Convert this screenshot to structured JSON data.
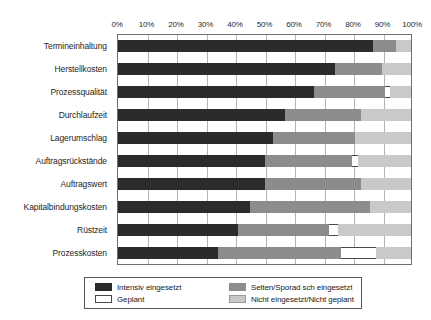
{
  "chart_data": {
    "type": "bar",
    "title": "",
    "subtitle": "",
    "orientation": "horizontal",
    "stacked": true,
    "normalized_percent": true,
    "xlabel": "",
    "ylabel": "",
    "xlim": [
      0,
      100
    ],
    "grid": true,
    "legend_position": "bottom",
    "tick_labels": [
      "0%",
      "10%",
      "20%",
      "30%",
      "40%",
      "50%",
      "60%",
      "70%",
      "80%",
      "90%",
      "100%"
    ],
    "tick_values": [
      0,
      10,
      20,
      30,
      40,
      50,
      60,
      70,
      80,
      90,
      100
    ],
    "categories": [
      "Termineinhaltung",
      "Herstellkosten",
      "Prozessqualität",
      "Durchlaufzeit",
      "Lagerumschlag",
      "Auftragsrückstände",
      "Auftragswert",
      "Kapitalbindungskosten",
      "Rüstzeit",
      "Prozesskosten"
    ],
    "series": [
      {
        "name": "Intensiv eingesetzt",
        "color": "#2b2b2b",
        "values": [
          87,
          74,
          67,
          57,
          53,
          50,
          50,
          45,
          41,
          34
        ]
      },
      {
        "name": "Selten/Sporad sch eingesetzt",
        "color": "#8c8c8c",
        "values": [
          8,
          16,
          24,
          26,
          28,
          30,
          33,
          41,
          31,
          42
        ]
      },
      {
        "name": "Geplant",
        "color": "#ffffff",
        "values": [
          0,
          0,
          2,
          0,
          0,
          2,
          0,
          0,
          3,
          12
        ]
      },
      {
        "name": "Nicht eingesetzt/Nicht geplant",
        "color": "#c9c9c9",
        "values": [
          5,
          10,
          7,
          17,
          19,
          18,
          17,
          14,
          25,
          12
        ]
      }
    ]
  },
  "legend": {
    "items": [
      {
        "label": "Intensiv eingesetzt",
        "swatch": "swatch-dark"
      },
      {
        "label": "Selten/Sporad sch eingesetzt",
        "swatch": "swatch-medium-gray"
      },
      {
        "label": "Geplant",
        "swatch": "swatch-white"
      },
      {
        "label": "Nicht eingesetzt/Nicht geplant",
        "swatch": "swatch-light-gray"
      }
    ]
  }
}
